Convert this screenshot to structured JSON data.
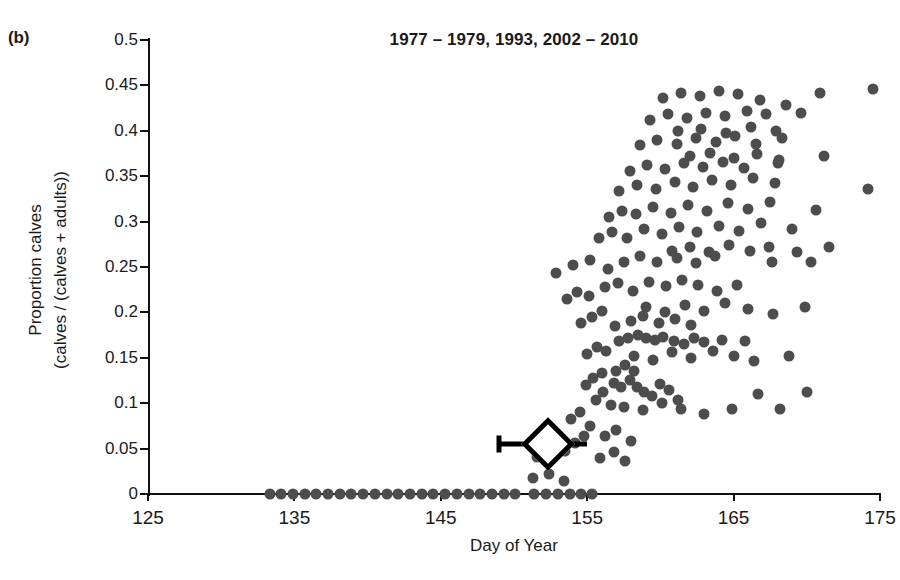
{
  "panel": {
    "label": "(b)"
  },
  "chart_data": {
    "type": "scatter",
    "title": "1977 – 1979, 1993, 2002 – 2010",
    "xlabel": "Day of Year",
    "ylabel": "Proportion calves\n(calves / (calves + adults))",
    "ylabel_line1": "Proportion calves",
    "ylabel_line2": "(calves / (calves + adults))",
    "xlim": [
      125,
      175
    ],
    "ylim": [
      0,
      0.5
    ],
    "grid": false,
    "legend": null,
    "xticks": [
      125,
      135,
      145,
      155,
      165,
      175
    ],
    "xtick_labels": [
      "125",
      "135",
      "145",
      "155",
      "165",
      "175"
    ],
    "yticks": [
      0,
      0.05,
      0.1,
      0.15,
      0.2,
      0.25,
      0.3,
      0.35,
      0.4,
      0.45,
      0.5
    ],
    "ytick_labels": [
      "0",
      "0.05",
      "0.1",
      "0.15",
      "0.2",
      "0.25",
      "0.3",
      "0.35",
      "0.4",
      "0.45",
      "0.5"
    ],
    "point_color": "#4d4d4d",
    "series": [
      {
        "name": "Observations",
        "marker": "circle",
        "points": [
          [
            133.3,
            0
          ],
          [
            134.1,
            0
          ],
          [
            134.9,
            0
          ],
          [
            135.7,
            0
          ],
          [
            136.5,
            0
          ],
          [
            137.3,
            0
          ],
          [
            138.1,
            0
          ],
          [
            138.9,
            0
          ],
          [
            139.7,
            0
          ],
          [
            140.5,
            0
          ],
          [
            141.3,
            0
          ],
          [
            142.1,
            0
          ],
          [
            142.9,
            0
          ],
          [
            143.7,
            0
          ],
          [
            144.5,
            0
          ],
          [
            145.3,
            0
          ],
          [
            146.1,
            0
          ],
          [
            146.9,
            0
          ],
          [
            147.7,
            0
          ],
          [
            148.5,
            0
          ],
          [
            149.3,
            0
          ],
          [
            150.1,
            0
          ],
          [
            151.4,
            0
          ],
          [
            152.2,
            0
          ],
          [
            153.0,
            0
          ],
          [
            153.8,
            0
          ],
          [
            154.6,
            0
          ],
          [
            155.3,
            0
          ],
          [
            151.3,
            0.018
          ],
          [
            152.4,
            0.022
          ],
          [
            153.4,
            0.014
          ],
          [
            151.6,
            0.041
          ],
          [
            152.0,
            0.053
          ],
          [
            152.1,
            0.068
          ],
          [
            153.5,
            0.047
          ],
          [
            154.2,
            0.056
          ],
          [
            154.8,
            0.064
          ],
          [
            153.9,
            0.083
          ],
          [
            154.5,
            0.09
          ],
          [
            155.2,
            0.075
          ],
          [
            155.6,
            0.104
          ],
          [
            156.1,
            0.112
          ],
          [
            156.6,
            0.098
          ],
          [
            154.9,
            0.12
          ],
          [
            155.4,
            0.128
          ],
          [
            156.0,
            0.133
          ],
          [
            156.8,
            0.122
          ],
          [
            157.3,
            0.118
          ],
          [
            157.9,
            0.126
          ],
          [
            158.4,
            0.118
          ],
          [
            158.9,
            0.112
          ],
          [
            159.4,
            0.108
          ],
          [
            160.0,
            0.121
          ],
          [
            160.6,
            0.114
          ],
          [
            161.2,
            0.104
          ],
          [
            157.0,
            0.136
          ],
          [
            157.6,
            0.142
          ],
          [
            158.2,
            0.135
          ],
          [
            155.0,
            0.154
          ],
          [
            155.7,
            0.162
          ],
          [
            156.3,
            0.158
          ],
          [
            157.2,
            0.168
          ],
          [
            157.8,
            0.172
          ],
          [
            158.5,
            0.175
          ],
          [
            159.0,
            0.172
          ],
          [
            159.6,
            0.17
          ],
          [
            160.2,
            0.173
          ],
          [
            160.9,
            0.168
          ],
          [
            161.6,
            0.165
          ],
          [
            162.3,
            0.172
          ],
          [
            163.0,
            0.167
          ],
          [
            164.2,
            0.17
          ],
          [
            165.8,
            0.168
          ],
          [
            154.6,
            0.188
          ],
          [
            155.3,
            0.195
          ],
          [
            156.0,
            0.202
          ],
          [
            156.9,
            0.185
          ],
          [
            158.0,
            0.19
          ],
          [
            158.8,
            0.196
          ],
          [
            159.9,
            0.188
          ],
          [
            161.0,
            0.193
          ],
          [
            162.1,
            0.186
          ],
          [
            153.6,
            0.215
          ],
          [
            154.3,
            0.222
          ],
          [
            155.1,
            0.218
          ],
          [
            156.2,
            0.228
          ],
          [
            157.1,
            0.232
          ],
          [
            158.1,
            0.224
          ],
          [
            159.2,
            0.233
          ],
          [
            160.4,
            0.229
          ],
          [
            161.5,
            0.236
          ],
          [
            162.6,
            0.23
          ],
          [
            163.9,
            0.224
          ],
          [
            165.2,
            0.23
          ],
          [
            152.9,
            0.243
          ],
          [
            154.0,
            0.252
          ],
          [
            155.2,
            0.258
          ],
          [
            156.4,
            0.248
          ],
          [
            157.5,
            0.256
          ],
          [
            158.6,
            0.262
          ],
          [
            159.8,
            0.255
          ],
          [
            161.1,
            0.26
          ],
          [
            162.4,
            0.254
          ],
          [
            163.7,
            0.262
          ],
          [
            167.6,
            0.255
          ],
          [
            170.3,
            0.256
          ],
          [
            155.8,
            0.282
          ],
          [
            156.7,
            0.288
          ],
          [
            157.7,
            0.282
          ],
          [
            158.9,
            0.292
          ],
          [
            160.1,
            0.286
          ],
          [
            161.3,
            0.294
          ],
          [
            162.5,
            0.288
          ],
          [
            164.0,
            0.295
          ],
          [
            165.4,
            0.29
          ],
          [
            166.9,
            0.298
          ],
          [
            169.0,
            0.292
          ],
          [
            156.5,
            0.305
          ],
          [
            157.4,
            0.312
          ],
          [
            158.3,
            0.308
          ],
          [
            159.5,
            0.316
          ],
          [
            160.7,
            0.31
          ],
          [
            161.9,
            0.318
          ],
          [
            163.2,
            0.312
          ],
          [
            164.6,
            0.32
          ],
          [
            166.0,
            0.314
          ],
          [
            167.5,
            0.322
          ],
          [
            170.6,
            0.313
          ],
          [
            157.2,
            0.334
          ],
          [
            158.4,
            0.34
          ],
          [
            159.7,
            0.336
          ],
          [
            161.0,
            0.344
          ],
          [
            162.2,
            0.338
          ],
          [
            163.5,
            0.346
          ],
          [
            164.8,
            0.34
          ],
          [
            166.3,
            0.348
          ],
          [
            167.8,
            0.342
          ],
          [
            174.2,
            0.336
          ],
          [
            157.9,
            0.356
          ],
          [
            159.1,
            0.362
          ],
          [
            160.3,
            0.358
          ],
          [
            161.6,
            0.364
          ],
          [
            162.9,
            0.36
          ],
          [
            164.3,
            0.366
          ],
          [
            165.7,
            0.359
          ],
          [
            168.0,
            0.364
          ],
          [
            158.6,
            0.384
          ],
          [
            159.8,
            0.39
          ],
          [
            161.1,
            0.386
          ],
          [
            162.4,
            0.392
          ],
          [
            163.8,
            0.388
          ],
          [
            165.1,
            0.394
          ],
          [
            166.5,
            0.386
          ],
          [
            168.3,
            0.392
          ],
          [
            159.3,
            0.412
          ],
          [
            160.5,
            0.418
          ],
          [
            161.8,
            0.414
          ],
          [
            163.1,
            0.42
          ],
          [
            164.4,
            0.416
          ],
          [
            165.9,
            0.422
          ],
          [
            167.2,
            0.418
          ],
          [
            169.6,
            0.42
          ],
          [
            160.2,
            0.436
          ],
          [
            161.4,
            0.442
          ],
          [
            162.7,
            0.438
          ],
          [
            164.0,
            0.444
          ],
          [
            165.3,
            0.44
          ],
          [
            166.8,
            0.434
          ],
          [
            168.6,
            0.428
          ],
          [
            170.9,
            0.442
          ],
          [
            174.5,
            0.446
          ],
          [
            161.2,
            0.4
          ],
          [
            162.8,
            0.402
          ],
          [
            164.5,
            0.398
          ],
          [
            166.2,
            0.404
          ],
          [
            167.9,
            0.4
          ],
          [
            162.0,
            0.372
          ],
          [
            163.4,
            0.376
          ],
          [
            165.0,
            0.37
          ],
          [
            166.6,
            0.374
          ],
          [
            168.1,
            0.368
          ],
          [
            171.2,
            0.372
          ],
          [
            160.8,
            0.268
          ],
          [
            162.0,
            0.272
          ],
          [
            163.3,
            0.266
          ],
          [
            164.7,
            0.274
          ],
          [
            166.1,
            0.268
          ],
          [
            167.4,
            0.272
          ],
          [
            169.3,
            0.266
          ],
          [
            171.5,
            0.272
          ],
          [
            159.0,
            0.206
          ],
          [
            160.3,
            0.2
          ],
          [
            161.7,
            0.208
          ],
          [
            163.0,
            0.202
          ],
          [
            164.4,
            0.21
          ],
          [
            166.0,
            0.204
          ],
          [
            167.7,
            0.198
          ],
          [
            169.9,
            0.206
          ],
          [
            158.2,
            0.152
          ],
          [
            159.5,
            0.148
          ],
          [
            160.8,
            0.156
          ],
          [
            162.1,
            0.15
          ],
          [
            163.6,
            0.158
          ],
          [
            165.0,
            0.152
          ],
          [
            166.4,
            0.146
          ],
          [
            168.8,
            0.152
          ],
          [
            157.5,
            0.096
          ],
          [
            158.8,
            0.092
          ],
          [
            160.1,
            0.1
          ],
          [
            161.4,
            0.094
          ],
          [
            163.0,
            0.088
          ],
          [
            164.9,
            0.094
          ],
          [
            166.7,
            0.11
          ],
          [
            168.2,
            0.094
          ],
          [
            170.0,
            0.112
          ],
          [
            156.2,
            0.064
          ],
          [
            157.0,
            0.07
          ],
          [
            158.0,
            0.058
          ],
          [
            155.9,
            0.04
          ],
          [
            156.8,
            0.046
          ],
          [
            157.6,
            0.036
          ]
        ]
      }
    ],
    "mean_marker": {
      "name": "Mean peak calving date",
      "marker": "diamond",
      "x": 152.3,
      "y": 0.055,
      "xerr_low": 149.0,
      "xerr_high": 155.0,
      "fill": "#ffffff",
      "edge": "#000000"
    }
  }
}
